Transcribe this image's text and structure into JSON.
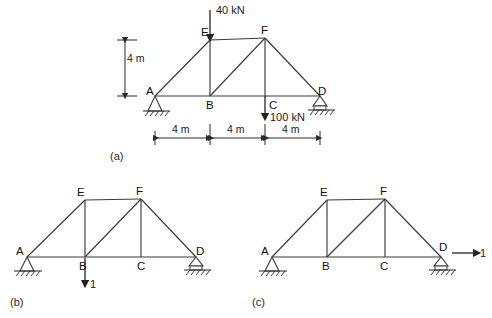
{
  "figure": {
    "background": "#ffffff",
    "line_color": "#3a3a3a",
    "text_color": "#1a1a1a"
  },
  "panels": [
    {
      "id": "a",
      "caption": "(a)",
      "nodes": [
        {
          "name": "A",
          "label": "A"
        },
        {
          "name": "B",
          "label": "B"
        },
        {
          "name": "C",
          "label": "C"
        },
        {
          "name": "D",
          "label": "D"
        },
        {
          "name": "E",
          "label": "E"
        },
        {
          "name": "F",
          "label": "F"
        }
      ],
      "supports": [
        {
          "at": "A",
          "type": "pinned"
        },
        {
          "at": "D",
          "type": "roller"
        }
      ],
      "loads": [
        {
          "at": "E",
          "label": "40 kN",
          "direction": "down"
        },
        {
          "at": "C",
          "label": "100 kN",
          "direction": "down"
        }
      ],
      "dimensions": {
        "vertical": "4 m",
        "horizontal": [
          "4 m",
          "4 m",
          "4 m"
        ]
      }
    },
    {
      "id": "b",
      "caption": "(b)",
      "nodes": [
        {
          "name": "A",
          "label": "A"
        },
        {
          "name": "B",
          "label": "B"
        },
        {
          "name": "C",
          "label": "C"
        },
        {
          "name": "D",
          "label": "D"
        },
        {
          "name": "E",
          "label": "E"
        },
        {
          "name": "F",
          "label": "F"
        }
      ],
      "supports": [
        {
          "at": "A",
          "type": "pinned"
        },
        {
          "at": "D",
          "type": "roller"
        }
      ],
      "loads": [
        {
          "at": "B",
          "label": "1",
          "direction": "down"
        }
      ]
    },
    {
      "id": "c",
      "caption": "(c)",
      "nodes": [
        {
          "name": "A",
          "label": "A"
        },
        {
          "name": "B",
          "label": "B"
        },
        {
          "name": "C",
          "label": "C"
        },
        {
          "name": "D",
          "label": "D"
        },
        {
          "name": "E",
          "label": "E"
        },
        {
          "name": "F",
          "label": "F"
        }
      ],
      "supports": [
        {
          "at": "A",
          "type": "pinned"
        },
        {
          "at": "D",
          "type": "roller"
        }
      ],
      "loads": [
        {
          "at": "D",
          "label": "1",
          "direction": "right"
        }
      ]
    }
  ]
}
